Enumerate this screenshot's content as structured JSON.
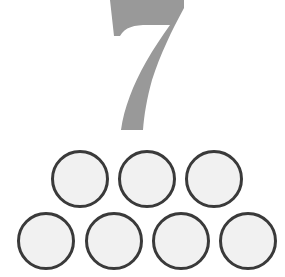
{
  "numeral": {
    "value": "7",
    "color": "#999999"
  },
  "counters": {
    "count": 7,
    "fill": "#f1f1f1",
    "stroke": "#3a3a3a",
    "rows": [
      {
        "items": [
          {
            "x": 51,
            "y": 150
          },
          {
            "x": 118,
            "y": 150
          },
          {
            "x": 185,
            "y": 150
          }
        ]
      },
      {
        "items": [
          {
            "x": 17,
            "y": 212
          },
          {
            "x": 85,
            "y": 212
          },
          {
            "x": 152,
            "y": 212
          },
          {
            "x": 219,
            "y": 212
          }
        ]
      }
    ]
  }
}
